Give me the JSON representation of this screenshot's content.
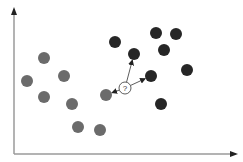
{
  "diagram": {
    "type": "knn-classification",
    "axes": {
      "origin": [
        14,
        154
      ],
      "x_end": [
        236,
        154
      ],
      "y_end": [
        14,
        9
      ],
      "color": "#9a9a9a",
      "arrow_color": "#222222"
    },
    "classes": [
      {
        "name": "class-a",
        "color": "#6b6b6b",
        "points": [
          [
            44,
            58
          ],
          [
            27,
            81
          ],
          [
            64,
            76
          ],
          [
            44,
            97
          ],
          [
            72,
            104
          ],
          [
            106,
            95
          ],
          [
            78,
            127
          ],
          [
            100,
            130
          ]
        ]
      },
      {
        "name": "class-b",
        "color": "#262626",
        "points": [
          [
            115,
            42
          ],
          [
            156,
            33
          ],
          [
            176,
            34
          ],
          [
            164,
            50
          ],
          [
            134,
            54
          ],
          [
            151,
            76
          ],
          [
            187,
            70
          ],
          [
            161,
            104
          ]
        ]
      }
    ],
    "point_radius": 6,
    "query": {
      "label": "?",
      "center": [
        125,
        88
      ],
      "radius": 6,
      "neighbors": [
        [
          134,
          54
        ],
        [
          151,
          76
        ],
        [
          106,
          95
        ]
      ]
    }
  }
}
